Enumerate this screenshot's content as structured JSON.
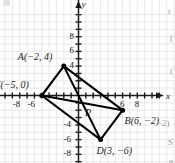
{
  "figure": {
    "kind": "coordinate-plane-diagram",
    "background_color": "#ffffff",
    "grid_color": "#e8e8e8",
    "axis_color": "#1a1a1a",
    "shape_color": "#000000"
  },
  "axes": {
    "x_axis_label": "x",
    "y_axis_label": "y",
    "x_ticks_visible": [
      "-8",
      "-6",
      "6",
      "8"
    ],
    "y_ticks_visible": [
      "8",
      "6",
      "4",
      "-4",
      "-6",
      "-8"
    ],
    "x_range": [
      -9,
      9
    ],
    "y_range": [
      -8.5,
      9.5
    ],
    "tick_step": 1,
    "grid": "on",
    "arrows": [
      "x-positive",
      "y-positive"
    ]
  },
  "points": [
    {
      "id": "A",
      "label": "A(−2, 4)",
      "x": -2,
      "y": 4,
      "dot": true,
      "label_dx": -46,
      "label_dy": -14
    },
    {
      "id": "C",
      "label": "C(−5, 0)",
      "x": -5,
      "y": 0,
      "dot": true,
      "label_dx": -48,
      "label_dy": -16
    },
    {
      "id": "B",
      "label": "B(6, −2)",
      "x": 6,
      "y": -2,
      "dot": true,
      "label_dx": 2,
      "label_dy": 6
    },
    {
      "id": "D",
      "label": "D(3, −6)",
      "x": 3,
      "y": -6,
      "dot": true,
      "label_dx": -4,
      "label_dy": 6
    },
    {
      "id": "P",
      "label": "P",
      "x": 0.6,
      "y": -1.6,
      "dot": false,
      "label_dx": 2,
      "label_dy": 1
    }
  ],
  "edges": [
    {
      "from": "A",
      "to": "C"
    },
    {
      "from": "C",
      "to": "D"
    },
    {
      "from": "D",
      "to": "B"
    },
    {
      "from": "B",
      "to": "A"
    }
  ],
  "diagonals": [
    {
      "from": "A",
      "to": "D"
    },
    {
      "from": "C",
      "to": "B"
    }
  ],
  "margin_fragments": [
    {
      "text": "r",
      "x": 168,
      "y": 6
    },
    {
      "text": "(",
      "x": 170,
      "y": 33
    },
    {
      "text": "(",
      "x": 170,
      "y": 66
    },
    {
      "text": "−2)",
      "x": 157,
      "y": 118
    },
    {
      "text": "S",
      "x": 168,
      "y": 137
    },
    {
      "text": "a",
      "x": 169,
      "y": 156
    }
  ]
}
